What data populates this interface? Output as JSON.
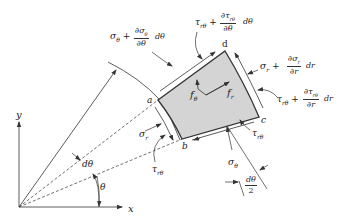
{
  "diagram": {
    "axes": {
      "x_label": "x",
      "y_label": "y"
    },
    "angles": {
      "theta": "θ",
      "dtheta": "dθ",
      "half_dtheta_num": "dθ",
      "half_dtheta_den": "2"
    },
    "corners": {
      "a": "a",
      "b": "b",
      "c": "c",
      "d": "d"
    },
    "body_forces": {
      "f_theta": "f",
      "f_theta_sub": "θ",
      "f_r": "f",
      "f_r_sub": "r"
    },
    "stresses": {
      "sigma_theta_plus": {
        "prefix": "σ",
        "prefix_sub": "θ",
        "plus": " + ",
        "num": "∂σ",
        "num_sub": "θ",
        "den": "∂θ",
        "suffix": "dθ"
      },
      "tau_rtheta_plus_theta": {
        "prefix": "τ",
        "prefix_sub": "rθ",
        "plus": " + ",
        "num": "∂τ",
        "num_sub": "rθ",
        "den": "∂θ",
        "suffix": "dθ"
      },
      "sigma_r_plus": {
        "prefix": "σ",
        "prefix_sub": "r",
        "plus": " + ",
        "num": "∂σ",
        "num_sub": "r",
        "den": "∂r",
        "suffix": "dr"
      },
      "tau_rtheta_plus_r": {
        "prefix": "τ",
        "prefix_sub": "rθ",
        "plus": " + ",
        "num": "∂τ",
        "num_sub": "rθ",
        "den": "∂r",
        "suffix": "dr"
      },
      "sigma_r": {
        "symbol": "σ",
        "sub": "r"
      },
      "tau_rtheta_left": {
        "symbol": "τ",
        "sub": "rθ"
      },
      "tau_rtheta_bottom": {
        "symbol": "τ",
        "sub": "rθ"
      },
      "sigma_theta": {
        "symbol": "σ",
        "sub": "θ"
      }
    },
    "colors": {
      "element_fill": "#d4d4d4",
      "line": "#333333"
    }
  }
}
